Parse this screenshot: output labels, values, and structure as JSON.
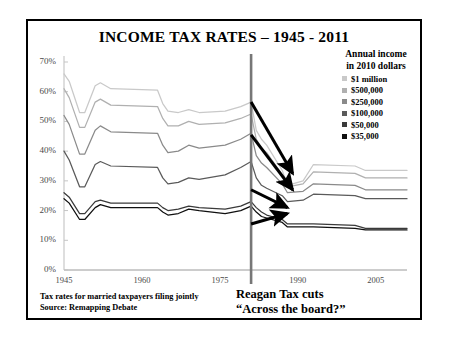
{
  "chart_data": {
    "type": "line",
    "title": "INCOME TAX RATES – 1945 - 2011",
    "xlabel": "",
    "ylabel": "",
    "xlim": [
      1945,
      2011
    ],
    "ylim": [
      0,
      70
    ],
    "grid": false,
    "legend_position": "top-right",
    "legend_title_line1": "Annual income",
    "legend_title_line2": "in 2010 dollars",
    "x_ticks": [
      "1945",
      "1960",
      "1975",
      "1990",
      "2005"
    ],
    "x_tick_values": [
      1945,
      1960,
      1975,
      1990,
      2005
    ],
    "y_ticks": [
      "0%",
      "10%",
      "20%",
      "30%",
      "40%",
      "50%",
      "60%",
      "70%"
    ],
    "y_tick_values": [
      0,
      10,
      20,
      30,
      40,
      50,
      60,
      70
    ],
    "series": [
      {
        "name": "$1 million",
        "color": "#c9c9c9",
        "x": [
          1945,
          1946,
          1948,
          1949,
          1951,
          1952,
          1954,
          1963,
          1964,
          1965,
          1967,
          1969,
          1971,
          1976,
          1979,
          1981,
          1982,
          1983,
          1984,
          1987,
          1988,
          1991,
          1993,
          2001,
          2003,
          2011
        ],
        "values": [
          66.0,
          63.5,
          53.0,
          53.0,
          62.0,
          63.0,
          61.0,
          60.5,
          56.0,
          53.5,
          53.0,
          54.0,
          53.0,
          53.5,
          55.0,
          56.5,
          47.0,
          44.0,
          42.0,
          33.5,
          28.5,
          30.0,
          35.5,
          35.0,
          33.5,
          33.5
        ]
      },
      {
        "name": "$500,000",
        "color": "#b0b0b0",
        "x": [
          1945,
          1946,
          1948,
          1949,
          1951,
          1952,
          1954,
          1963,
          1964,
          1965,
          1967,
          1969,
          1971,
          1976,
          1979,
          1981,
          1982,
          1983,
          1984,
          1987,
          1988,
          1991,
          1993,
          2001,
          2003,
          2011
        ],
        "values": [
          61.0,
          58.0,
          48.0,
          48.0,
          56.5,
          57.5,
          55.5,
          55.0,
          51.0,
          48.5,
          48.5,
          50.0,
          49.0,
          49.5,
          51.0,
          52.5,
          44.0,
          41.0,
          39.5,
          32.0,
          28.0,
          29.0,
          33.0,
          32.5,
          31.0,
          31.0
        ]
      },
      {
        "name": "$250,000",
        "color": "#8a8a8a",
        "x": [
          1945,
          1946,
          1948,
          1949,
          1951,
          1952,
          1954,
          1963,
          1964,
          1965,
          1967,
          1969,
          1971,
          1976,
          1979,
          1981,
          1982,
          1983,
          1984,
          1987,
          1988,
          1991,
          1993,
          2001,
          2003,
          2011
        ],
        "values": [
          52.0,
          49.0,
          39.0,
          39.0,
          47.0,
          48.5,
          46.5,
          46.0,
          42.0,
          39.5,
          40.0,
          42.0,
          41.0,
          42.0,
          44.0,
          46.0,
          38.5,
          36.0,
          34.5,
          29.0,
          26.0,
          26.5,
          29.0,
          28.5,
          27.0,
          27.0
        ]
      },
      {
        "name": "$100,000",
        "color": "#5a5a5a",
        "x": [
          1945,
          1946,
          1948,
          1949,
          1951,
          1952,
          1954,
          1963,
          1964,
          1965,
          1967,
          1969,
          1971,
          1976,
          1979,
          1981,
          1982,
          1983,
          1984,
          1987,
          1988,
          1991,
          1993,
          2001,
          2003,
          2011
        ],
        "values": [
          40.0,
          37.0,
          28.0,
          28.0,
          35.5,
          36.5,
          35.0,
          34.5,
          31.0,
          29.0,
          29.5,
          31.0,
          30.5,
          32.0,
          34.5,
          36.5,
          31.0,
          28.5,
          27.5,
          25.0,
          23.0,
          23.5,
          25.5,
          25.0,
          24.0,
          24.0
        ]
      },
      {
        "name": "$50,000",
        "color": "#3a3a3a",
        "x": [
          1945,
          1946,
          1948,
          1949,
          1951,
          1952,
          1954,
          1963,
          1964,
          1965,
          1967,
          1969,
          1971,
          1976,
          1979,
          1981,
          1982,
          1983,
          1984,
          1987,
          1988,
          1991,
          1993,
          2001,
          2003,
          2011
        ],
        "values": [
          26.0,
          24.5,
          19.0,
          19.0,
          23.0,
          23.5,
          22.5,
          22.5,
          21.0,
          20.0,
          20.5,
          21.5,
          21.0,
          20.5,
          21.5,
          23.0,
          21.0,
          19.5,
          18.5,
          17.0,
          15.5,
          15.5,
          15.5,
          15.0,
          14.0,
          14.0
        ]
      },
      {
        "name": "$35,000",
        "color": "#101010",
        "x": [
          1945,
          1946,
          1948,
          1949,
          1951,
          1952,
          1954,
          1963,
          1964,
          1965,
          1967,
          1969,
          1971,
          1976,
          1979,
          1981,
          1982,
          1983,
          1984,
          1987,
          1988,
          1991,
          1993,
          2001,
          2003,
          2011
        ],
        "values": [
          24.0,
          22.5,
          17.0,
          17.0,
          21.0,
          22.0,
          21.0,
          21.0,
          19.5,
          18.5,
          19.0,
          20.5,
          20.0,
          19.0,
          20.0,
          21.5,
          19.5,
          18.0,
          17.5,
          16.0,
          14.5,
          14.5,
          14.5,
          14.0,
          13.5,
          13.5
        ]
      }
    ],
    "annotations": {
      "vline_year": 1981,
      "vline_color": "#777777",
      "arrows": [
        {
          "from_year": 1981,
          "from_value": 56.5,
          "to_year": 1989,
          "to_value": 32.5
        },
        {
          "from_year": 1981,
          "from_value": 45.5,
          "to_year": 1989,
          "to_value": 27.0
        },
        {
          "from_year": 1981,
          "from_value": 27.0,
          "to_year": 1988,
          "to_value": 21.0
        },
        {
          "from_year": 1981,
          "from_value": 15.5,
          "to_year": 1988,
          "to_value": 19.0
        }
      ]
    }
  },
  "caption_left_line1": "Tax rates for married taxpayers filing jointly",
  "caption_left_line2": "Source: Remapping Debate",
  "caption_right_line1": "Reagan Tax cuts",
  "caption_right_line2": "“Across the board?”"
}
